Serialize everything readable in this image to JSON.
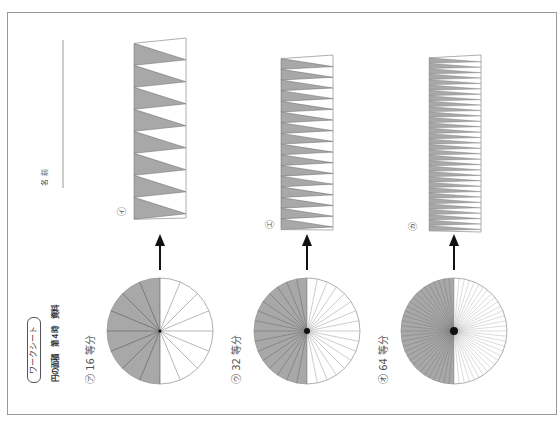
{
  "worksheet": {
    "title": "ワークシート",
    "subtitle": "円の面積　第４時　資料",
    "name_label": "名前",
    "orientation": "rotated-90-ccw",
    "colors": {
      "frame": "#9a9a9a",
      "shade": "#a8a8a8",
      "line": "#666666",
      "light_line": "#9a9a9a",
      "arrow": "#111111",
      "text": "#333333"
    }
  },
  "panels": [
    {
      "circle_label": "㋐ 16 等分",
      "divisions": 16,
      "strip_label": "㋑",
      "circle": {
        "cx": 160,
        "cy": 331,
        "r": 53
      },
      "strip": {
        "x": 134,
        "w": 52,
        "top": 40,
        "bottom": 216
      },
      "strip_label_pos": {
        "x": 124,
        "y": 209
      },
      "label_pos": {
        "x": 88,
        "y": 382
      }
    },
    {
      "circle_label": "㋒ 32 等分",
      "divisions": 32,
      "strip_label": "㋓",
      "circle": {
        "cx": 307,
        "cy": 331,
        "r": 53
      },
      "strip": {
        "x": 281,
        "w": 52,
        "top": 57,
        "bottom": 228
      },
      "strip_label_pos": {
        "x": 272,
        "y": 222
      },
      "label_pos": {
        "x": 234,
        "y": 382
      }
    },
    {
      "circle_label": "㋔ 64 等分",
      "divisions": 64,
      "strip_label": "㋕",
      "circle": {
        "cx": 454,
        "cy": 331,
        "r": 53
      },
      "strip": {
        "x": 429,
        "w": 52,
        "top": 57,
        "bottom": 230
      },
      "strip_label_pos": {
        "x": 415,
        "y": 224
      },
      "label_pos": {
        "x": 382,
        "y": 382
      }
    }
  ]
}
